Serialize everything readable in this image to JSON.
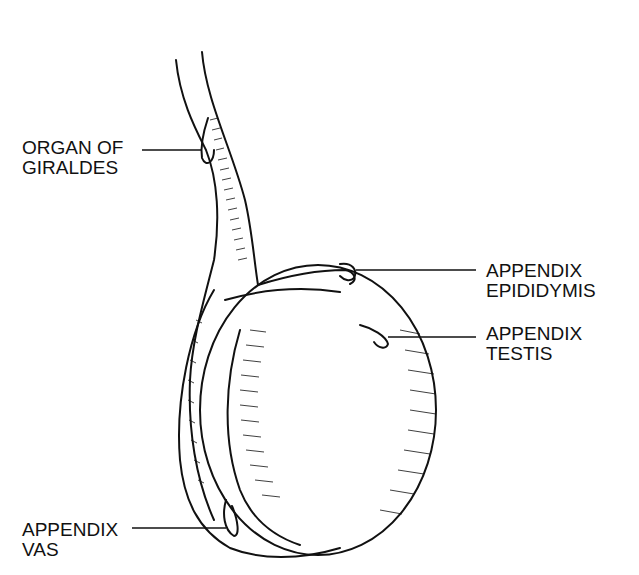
{
  "diagram": {
    "labels": [
      {
        "id": "organ-of-giraldes",
        "lines": [
          "ORGAN OF",
          "GIRALDES"
        ]
      },
      {
        "id": "appendix-epididymis",
        "lines": [
          "APPENDIX",
          "EPIDIDYMIS"
        ]
      },
      {
        "id": "appendix-testis",
        "lines": [
          "APPENDIX",
          "TESTIS"
        ]
      },
      {
        "id": "appendix-vas",
        "lines": [
          "APPENDIX",
          "VAS"
        ]
      }
    ],
    "colors": {
      "ink": "#111111",
      "background": "#ffffff"
    }
  }
}
